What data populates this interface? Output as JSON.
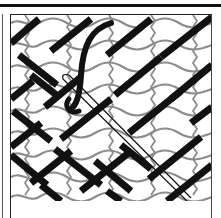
{
  "figure": {
    "elements": [
      "top-rule",
      "frame",
      "mesh-canvas",
      "diagonal-stitches",
      "needle",
      "thread-loop"
    ],
    "colors": {
      "ink": "#111111",
      "mesh": "#8c8c8c",
      "background": "#ffffff"
    }
  }
}
